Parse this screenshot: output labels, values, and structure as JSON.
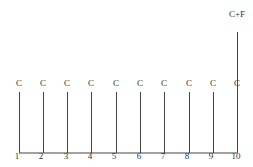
{
  "diagram": {
    "type": "cash-flow-timeline",
    "periods": [
      "1",
      "2",
      "3",
      "4",
      "5",
      "6",
      "7",
      "8",
      "9",
      "10"
    ],
    "flows": [
      {
        "period": "1",
        "label": "C",
        "magnitude": "coupon"
      },
      {
        "period": "2",
        "label": "C",
        "magnitude": "coupon"
      },
      {
        "period": "3",
        "label": "C",
        "magnitude": "coupon"
      },
      {
        "period": "4",
        "label": "C",
        "magnitude": "coupon"
      },
      {
        "period": "5",
        "label": "C",
        "magnitude": "coupon"
      },
      {
        "period": "6",
        "label": "C",
        "magnitude": "coupon"
      },
      {
        "period": "7",
        "label": "C",
        "magnitude": "coupon"
      },
      {
        "period": "8",
        "label": "C",
        "magnitude": "coupon"
      },
      {
        "period": "9",
        "label": "C",
        "magnitude": "coupon"
      },
      {
        "period": "10",
        "label": "C",
        "magnitude": "coupon"
      }
    ],
    "final_flow": {
      "period": "10",
      "label": "C+F"
    },
    "colors": {
      "line": "#444444",
      "text": "#333333"
    }
  }
}
